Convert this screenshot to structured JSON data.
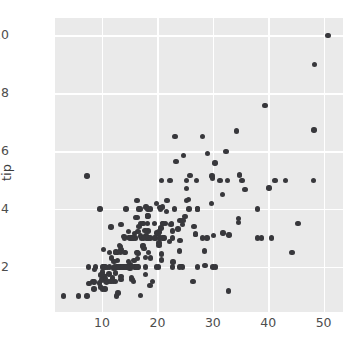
{
  "chart_data": {
    "type": "scatter",
    "title": "",
    "xlabel": "",
    "ylabel": "tip",
    "xlim": [
      1.5,
      53.5
    ],
    "ylim": [
      0.45,
      10.6
    ],
    "xticks": [
      10,
      20,
      30,
      40,
      50
    ],
    "yticks": [
      2,
      4,
      6,
      8,
      10
    ],
    "xtick_labels": [
      "10",
      "20",
      "30",
      "40",
      "50"
    ],
    "ytick_labels": [
      "2",
      "4",
      "6",
      "8",
      "10"
    ],
    "grid": true,
    "legend": null,
    "marker_color": "#38383c",
    "axes_facecolor": "#eaeaea",
    "grid_color": "#ffffff",
    "x_series_name": "total_bill",
    "y_series_name": "tip",
    "n_points": 244,
    "points": [
      [
        16.99,
        1.01
      ],
      [
        10.34,
        1.66
      ],
      [
        21.01,
        3.5
      ],
      [
        23.68,
        3.31
      ],
      [
        24.59,
        3.61
      ],
      [
        25.29,
        4.71
      ],
      [
        8.77,
        2.0
      ],
      [
        26.88,
        3.12
      ],
      [
        15.04,
        1.96
      ],
      [
        14.78,
        3.23
      ],
      [
        10.27,
        1.71
      ],
      [
        35.26,
        5.0
      ],
      [
        15.42,
        1.57
      ],
      [
        18.43,
        3.0
      ],
      [
        14.83,
        3.02
      ],
      [
        21.58,
        3.92
      ],
      [
        10.33,
        1.67
      ],
      [
        16.29,
        3.71
      ],
      [
        16.97,
        3.5
      ],
      [
        20.65,
        3.35
      ],
      [
        17.92,
        4.08
      ],
      [
        20.29,
        2.75
      ],
      [
        15.77,
        2.23
      ],
      [
        39.42,
        7.58
      ],
      [
        19.82,
        3.18
      ],
      [
        17.81,
        2.34
      ],
      [
        13.37,
        2.0
      ],
      [
        12.69,
        2.0
      ],
      [
        21.7,
        4.3
      ],
      [
        19.65,
        3.0
      ],
      [
        9.55,
        1.45
      ],
      [
        18.35,
        2.5
      ],
      [
        15.06,
        3.0
      ],
      [
        20.69,
        2.45
      ],
      [
        17.78,
        3.27
      ],
      [
        24.06,
        3.6
      ],
      [
        16.31,
        2.0
      ],
      [
        16.93,
        3.07
      ],
      [
        18.69,
        2.31
      ],
      [
        31.27,
        5.0
      ],
      [
        16.04,
        3.71
      ],
      [
        17.46,
        2.74
      ],
      [
        13.94,
        3.06
      ],
      [
        9.68,
        1.32
      ],
      [
        30.4,
        5.6
      ],
      [
        18.29,
        3.0
      ],
      [
        22.23,
        5.0
      ],
      [
        32.4,
        6.0
      ],
      [
        28.55,
        2.05
      ],
      [
        18.04,
        3.0
      ],
      [
        12.54,
        2.5
      ],
      [
        10.29,
        2.6
      ],
      [
        34.81,
        5.2
      ],
      [
        9.94,
        1.56
      ],
      [
        25.56,
        4.34
      ],
      [
        19.49,
        3.51
      ],
      [
        38.01,
        3.0
      ],
      [
        26.41,
        1.5
      ],
      [
        11.24,
        1.76
      ],
      [
        48.27,
        6.73
      ],
      [
        20.29,
        3.21
      ],
      [
        13.81,
        2.0
      ],
      [
        11.02,
        1.98
      ],
      [
        18.29,
        3.76
      ],
      [
        17.59,
        2.64
      ],
      [
        20.08,
        3.15
      ],
      [
        16.45,
        2.47
      ],
      [
        3.07,
        1.0
      ],
      [
        20.23,
        2.01
      ],
      [
        15.01,
        2.09
      ],
      [
        12.02,
        1.97
      ],
      [
        17.07,
        3.0
      ],
      [
        26.86,
        3.14
      ],
      [
        25.28,
        5.0
      ],
      [
        14.73,
        2.2
      ],
      [
        10.51,
        1.25
      ],
      [
        17.92,
        3.08
      ],
      [
        27.2,
        4.0
      ],
      [
        22.76,
        3.0
      ],
      [
        17.29,
        2.71
      ],
      [
        19.44,
        3.0
      ],
      [
        16.66,
        3.4
      ],
      [
        10.07,
        1.83
      ],
      [
        32.68,
        5.0
      ],
      [
        15.98,
        2.03
      ],
      [
        34.83,
        5.17
      ],
      [
        13.03,
        2.0
      ],
      [
        18.28,
        4.0
      ],
      [
        24.71,
        5.85
      ],
      [
        21.16,
        3.0
      ],
      [
        28.97,
        3.0
      ],
      [
        22.49,
        3.5
      ],
      [
        5.75,
        1.0
      ],
      [
        16.32,
        4.3
      ],
      [
        22.75,
        3.25
      ],
      [
        40.17,
        4.73
      ],
      [
        27.28,
        4.0
      ],
      [
        12.03,
        1.5
      ],
      [
        21.01,
        3.0
      ],
      [
        12.46,
        1.5
      ],
      [
        11.35,
        2.5
      ],
      [
        15.38,
        3.0
      ],
      [
        44.3,
        2.5
      ],
      [
        22.42,
        3.48
      ],
      [
        20.92,
        4.08
      ],
      [
        15.36,
        1.64
      ],
      [
        20.49,
        4.06
      ],
      [
        25.21,
        4.29
      ],
      [
        18.24,
        3.76
      ],
      [
        14.31,
        4.0
      ],
      [
        14.0,
        3.0
      ],
      [
        7.25,
        1.0
      ],
      [
        38.07,
        4.0
      ],
      [
        23.95,
        2.55
      ],
      [
        25.71,
        4.0
      ],
      [
        17.31,
        3.5
      ],
      [
        29.93,
        5.07
      ],
      [
        10.65,
        1.5
      ],
      [
        12.43,
        1.8
      ],
      [
        24.08,
        2.92
      ],
      [
        11.69,
        2.31
      ],
      [
        13.42,
        1.68
      ],
      [
        14.26,
        2.5
      ],
      [
        15.95,
        2.0
      ],
      [
        12.48,
        2.52
      ],
      [
        29.8,
        4.2
      ],
      [
        8.52,
        1.48
      ],
      [
        14.52,
        2.0
      ],
      [
        11.38,
        2.0
      ],
      [
        22.82,
        2.18
      ],
      [
        19.08,
        1.5
      ],
      [
        20.27,
        2.83
      ],
      [
        11.17,
        1.5
      ],
      [
        12.26,
        2.0
      ],
      [
        18.26,
        3.25
      ],
      [
        8.51,
        1.25
      ],
      [
        10.33,
        2.0
      ],
      [
        14.15,
        2.0
      ],
      [
        16.0,
        2.0
      ],
      [
        13.16,
        2.75
      ],
      [
        17.47,
        3.5
      ],
      [
        34.3,
        6.7
      ],
      [
        41.19,
        5.0
      ],
      [
        27.05,
        5.0
      ],
      [
        16.43,
        2.3
      ],
      [
        8.35,
        1.5
      ],
      [
        18.64,
        1.36
      ],
      [
        11.87,
        1.63
      ],
      [
        9.78,
        1.73
      ],
      [
        7.51,
        2.0
      ],
      [
        14.07,
        2.5
      ],
      [
        13.13,
        2.0
      ],
      [
        17.26,
        2.74
      ],
      [
        24.55,
        2.0
      ],
      [
        19.77,
        2.0
      ],
      [
        29.85,
        5.14
      ],
      [
        48.17,
        5.0
      ],
      [
        25.0,
        3.75
      ],
      [
        13.39,
        2.61
      ],
      [
        16.49,
        2.0
      ],
      [
        21.5,
        3.5
      ],
      [
        12.66,
        2.5
      ],
      [
        16.21,
        2.0
      ],
      [
        13.81,
        2.0
      ],
      [
        17.51,
        3.0
      ],
      [
        24.52,
        3.48
      ],
      [
        20.76,
        2.24
      ],
      [
        31.71,
        4.5
      ],
      [
        10.59,
        1.61
      ],
      [
        10.63,
        2.0
      ],
      [
        50.81,
        10.0
      ],
      [
        15.81,
        3.16
      ],
      [
        7.25,
        5.15
      ],
      [
        31.85,
        3.18
      ],
      [
        16.82,
        4.0
      ],
      [
        32.9,
        3.11
      ],
      [
        17.89,
        2.0
      ],
      [
        14.48,
        2.0
      ],
      [
        9.6,
        4.0
      ],
      [
        34.63,
        3.55
      ],
      [
        34.65,
        3.68
      ],
      [
        23.33,
        5.65
      ],
      [
        45.35,
        3.5
      ],
      [
        23.17,
        6.5
      ],
      [
        40.55,
        3.0
      ],
      [
        20.69,
        5.0
      ],
      [
        20.9,
        3.5
      ],
      [
        30.46,
        2.0
      ],
      [
        18.15,
        3.5
      ],
      [
        23.1,
        4.0
      ],
      [
        15.69,
        1.5
      ],
      [
        19.81,
        4.19
      ],
      [
        28.44,
        2.56
      ],
      [
        15.48,
        2.02
      ],
      [
        16.58,
        4.0
      ],
      [
        7.56,
        1.44
      ],
      [
        10.34,
        2.0
      ],
      [
        43.11,
        5.0
      ],
      [
        13.0,
        2.0
      ],
      [
        13.51,
        2.0
      ],
      [
        18.71,
        4.0
      ],
      [
        12.74,
        2.01
      ],
      [
        13.0,
        2.0
      ],
      [
        16.4,
        2.5
      ],
      [
        20.53,
        4.0
      ],
      [
        16.47,
        3.23
      ],
      [
        26.59,
        3.41
      ],
      [
        38.73,
        3.0
      ],
      [
        24.27,
        2.03
      ],
      [
        12.76,
        2.23
      ],
      [
        30.06,
        2.0
      ],
      [
        25.89,
        5.16
      ],
      [
        48.33,
        9.0
      ],
      [
        13.27,
        2.5
      ],
      [
        28.17,
        6.5
      ],
      [
        12.9,
        1.1
      ],
      [
        28.15,
        3.0
      ],
      [
        11.59,
        1.5
      ],
      [
        7.74,
        1.44
      ],
      [
        30.14,
        3.09
      ],
      [
        12.16,
        2.2
      ],
      [
        13.42,
        3.48
      ],
      [
        8.58,
        1.92
      ],
      [
        15.98,
        3.0
      ],
      [
        13.42,
        1.58
      ],
      [
        16.27,
        2.5
      ],
      [
        10.09,
        2.0
      ],
      [
        20.45,
        3.0
      ],
      [
        13.28,
        2.72
      ],
      [
        22.12,
        2.88
      ],
      [
        24.01,
        2.0
      ],
      [
        15.69,
        3.0
      ],
      [
        11.61,
        3.39
      ],
      [
        10.77,
        1.47
      ],
      [
        15.53,
        3.0
      ],
      [
        10.07,
        1.25
      ],
      [
        12.6,
        1.0
      ],
      [
        32.83,
        1.17
      ],
      [
        35.83,
        4.67
      ],
      [
        29.03,
        5.92
      ],
      [
        27.18,
        2.0
      ],
      [
        22.67,
        2.0
      ],
      [
        17.82,
        1.75
      ],
      [
        18.78,
        3.0
      ]
    ]
  }
}
